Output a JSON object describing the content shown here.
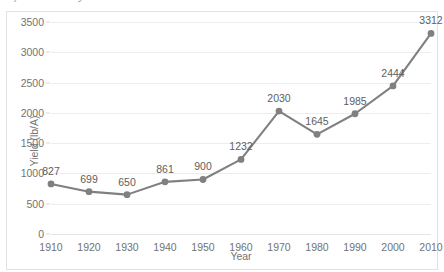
{
  "caption": {
    "clipped_text": "your needs vary."
  },
  "chart_data": {
    "type": "line",
    "title": "",
    "xlabel": "Year",
    "ylabel": "Yield (lb/A)",
    "categories": [
      1910,
      1920,
      1930,
      1940,
      1950,
      1960,
      1970,
      1980,
      1990,
      2000,
      2010
    ],
    "values": [
      827,
      699,
      650,
      861,
      900,
      1232,
      2030,
      1645,
      1985,
      2444,
      3312
    ],
    "point_labels": [
      "827",
      "699",
      "650",
      "861",
      "900",
      "1232",
      "2030",
      "1645",
      "1985",
      "2444",
      "3312"
    ],
    "xtick_labels": [
      "1910",
      "1920",
      "1930",
      "1940",
      "1950",
      "1960",
      "1970",
      "1980",
      "1990",
      "2000",
      "2010"
    ],
    "ytick_values": [
      0,
      500,
      1000,
      1500,
      2000,
      2500,
      3000,
      3500
    ],
    "ytick_labels": [
      "0",
      "500",
      "1000",
      "1500",
      "2000",
      "2500",
      "3000",
      "3500"
    ],
    "ylim": [
      0,
      3500
    ],
    "xlim": [
      1910,
      2010
    ],
    "grid": "horizontal",
    "legend": "none",
    "series_color": "#808080",
    "marker": "circle",
    "marker_color": "#808080",
    "gridline_color": "#ededed"
  }
}
